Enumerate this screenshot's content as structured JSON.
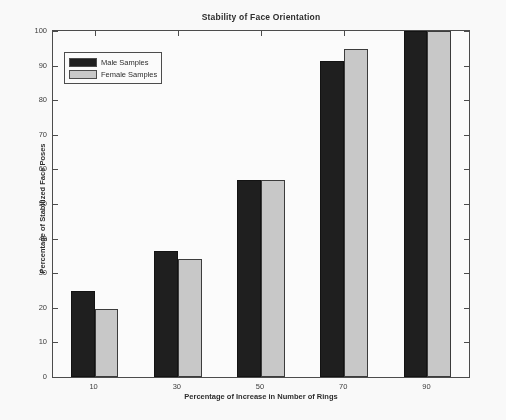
{
  "chart_data": {
    "type": "bar",
    "title": "Stability of Face Orientation",
    "xlabel": "Percentage of Increase in Number of Rings",
    "ylabel": "Percentage of Stabilized Face Poses",
    "categories": [
      "10",
      "30",
      "50",
      "70",
      "90"
    ],
    "series": [
      {
        "name": "Male Samples",
        "color": "#1c1c1c",
        "values": [
          24.8,
          36.3,
          56.8,
          91.2,
          100
        ]
      },
      {
        "name": "Female Samples",
        "color": "#cacaca",
        "values": [
          19.6,
          34.0,
          56.8,
          94.8,
          100
        ]
      }
    ],
    "ylim": [
      0,
      100
    ],
    "yticks": [
      0,
      10,
      20,
      30,
      40,
      50,
      60,
      70,
      80,
      90,
      100
    ],
    "ytick_labels": [
      "0",
      "10",
      "20",
      "30",
      "40",
      "50",
      "60",
      "70",
      "80",
      "90",
      "100"
    ],
    "xticks": [
      "10",
      "30",
      "50",
      "70",
      "90"
    ],
    "grid": false,
    "legend_position": "upper left",
    "frame": true
  },
  "legend": {
    "items": [
      {
        "label": "Male Samples"
      },
      {
        "label": "Female Samples"
      }
    ]
  }
}
